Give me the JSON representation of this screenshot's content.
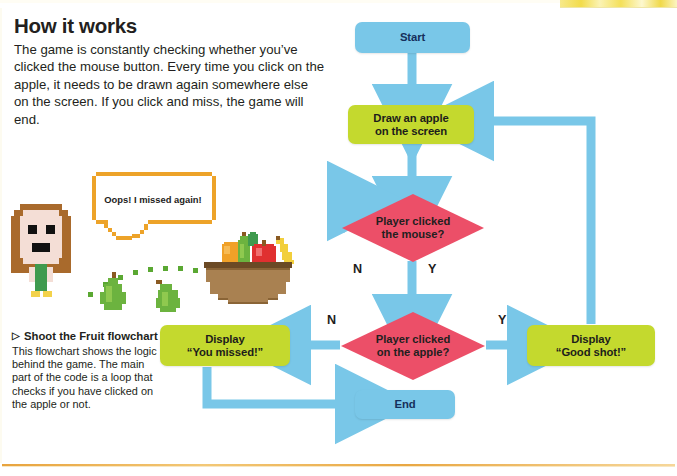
{
  "article": {
    "headline": "How it works",
    "intro": "The game is constantly checking whether you’ve clicked the mouse button. Every time you click on the apple, it needs to be drawn again somewhere else on the screen. If you click and miss, the game will end."
  },
  "caption": {
    "marker": "▷",
    "title": "Shoot the Fruit flowchart",
    "body": "This flowchart shows the logic behind the game. The main part of the code is a loop that checks if you have clicked on the apple or not."
  },
  "illustration": {
    "speech_bubble": "Oops! I missed again!",
    "character_name": "pixel-girl-character",
    "fruit_bowl_name": "pixel-fruit-bowl",
    "flying_fruit": [
      "pear-1",
      "pear-2"
    ],
    "trail_name": "dotted-motion-trail"
  },
  "flowchart": {
    "type": "flowchart",
    "colors": {
      "terminator": "#79c7e8",
      "process": "#c4d92e",
      "decision": "#ec4f68",
      "arrow": "#79c7e8",
      "terminator_text": "#16305c"
    },
    "nodes": [
      {
        "id": "start",
        "shape": "rounded-rect",
        "label": "Start"
      },
      {
        "id": "draw-apple",
        "shape": "rounded-rect",
        "label_line1": "Draw an apple",
        "label_line2": "on the screen"
      },
      {
        "id": "clicked-mouse",
        "shape": "diamond",
        "label_line1": "Player clicked",
        "label_line2": "the mouse?"
      },
      {
        "id": "clicked-apple",
        "shape": "diamond",
        "label_line1": "Player clicked",
        "label_line2": "on the apple?"
      },
      {
        "id": "you-missed",
        "shape": "rounded-rect",
        "label_line1": "Display",
        "label_line2": "“You missed!”"
      },
      {
        "id": "good-shot",
        "shape": "rounded-rect",
        "label_line1": "Display",
        "label_line2": "“Good shot!”"
      },
      {
        "id": "end",
        "shape": "rounded-rect",
        "label": "End"
      }
    ],
    "branch_labels": {
      "mouse_no": "N",
      "mouse_yes": "Y",
      "apple_no": "N",
      "apple_yes": "Y"
    },
    "edges": [
      {
        "from": "start",
        "to": "draw-apple",
        "label": ""
      },
      {
        "from": "draw-apple",
        "to": "clicked-mouse",
        "label": ""
      },
      {
        "from": "clicked-mouse",
        "to": "clicked-mouse",
        "label": "N"
      },
      {
        "from": "clicked-mouse",
        "to": "clicked-apple",
        "label": "Y"
      },
      {
        "from": "clicked-apple",
        "to": "you-missed",
        "label": "N"
      },
      {
        "from": "clicked-apple",
        "to": "good-shot",
        "label": "Y"
      },
      {
        "from": "you-missed",
        "to": "end",
        "label": ""
      },
      {
        "from": "good-shot",
        "to": "draw-apple",
        "label": ""
      }
    ]
  }
}
